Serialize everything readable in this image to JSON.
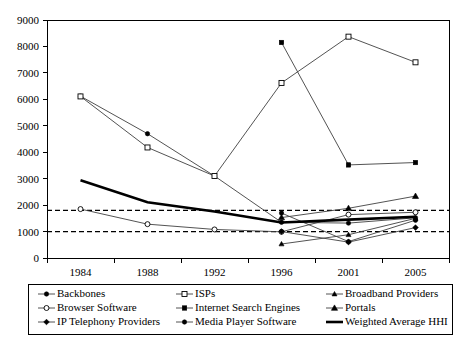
{
  "chart_data": {
    "type": "line",
    "title": "",
    "subtitle": "",
    "xlabel": "",
    "ylabel": "",
    "categories": [
      "1984",
      "1988",
      "1992",
      "1996",
      "2001",
      "2005"
    ],
    "ylim": [
      0,
      9000
    ],
    "ytick_step": 1000,
    "yticks": [
      "0",
      "1000",
      "2000",
      "3000",
      "4000",
      "5000",
      "6000",
      "7000",
      "8000",
      "9000"
    ],
    "grid": false,
    "legend_position": "bottom",
    "legend_columns": 3,
    "reference_lines": [
      {
        "name": "highly-concentrated-threshold",
        "value": 1800,
        "style": "dashed"
      },
      {
        "name": "moderately-concentrated-threshold",
        "value": 1000,
        "style": "dashed"
      }
    ],
    "series": [
      {
        "name": "Backbones",
        "marker": "filled-circle",
        "line": "thin",
        "x": [
          "1984",
          "1988",
          "1992",
          "1996",
          "2001",
          "2005"
        ],
        "values": [
          6120,
          4700,
          3100,
          1350,
          1320,
          1520
        ]
      },
      {
        "name": "ISPs",
        "marker": "hollow-square",
        "line": "thin",
        "x": [
          "1984",
          "1988",
          "1992",
          "1996",
          "2001",
          "2005"
        ],
        "values": [
          6110,
          4180,
          3100,
          6620,
          8370,
          7400
        ]
      },
      {
        "name": "Broadband Providers",
        "marker": "filled-triangle-small",
        "line": "thin",
        "x": [
          "1996",
          "2001",
          "2005"
        ],
        "values": [
          530,
          880,
          1500
        ]
      },
      {
        "name": "Browser Software",
        "marker": "hollow-circle",
        "line": "thin",
        "x": [
          "1984",
          "1988",
          "1992",
          "1996",
          "2001",
          "2005"
        ],
        "values": [
          1850,
          1280,
          1080,
          990,
          1640,
          1730
        ]
      },
      {
        "name": "Internet Search Engines",
        "marker": "filled-square",
        "line": "thin",
        "x": [
          "1996",
          "2001",
          "2005"
        ],
        "values": [
          8150,
          3520,
          3610
        ]
      },
      {
        "name": "Portals",
        "marker": "filled-triangle",
        "line": "thin",
        "x": [
          "1996",
          "2001",
          "2005"
        ],
        "values": [
          1530,
          1880,
          2340
        ]
      },
      {
        "name": "IP Telephony Providers",
        "marker": "filled-diamond",
        "line": "thin",
        "x": [
          "1996",
          "2001",
          "2005"
        ],
        "values": [
          1000,
          600,
          1150
        ]
      },
      {
        "name": "Media Player Software",
        "marker": "filled-circle",
        "line": "thin",
        "x": [
          "1996",
          "2001",
          "2005"
        ],
        "values": [
          1700,
          620,
          1430
        ]
      },
      {
        "name": "Weighted Average HHI",
        "marker": "none",
        "line": "bold",
        "x": [
          "1984",
          "1988",
          "1992",
          "1996",
          "2001",
          "2005"
        ],
        "values": [
          2940,
          2110,
          1760,
          1340,
          1450,
          1560
        ]
      }
    ],
    "legend": [
      {
        "label": "Backbones",
        "marker": "filled-circle",
        "line": "thin"
      },
      {
        "label": "ISPs",
        "marker": "hollow-square",
        "line": "thin"
      },
      {
        "label": "Broadband Providers",
        "marker": "filled-triangle-small",
        "line": "thin"
      },
      {
        "label": "Browser Software",
        "marker": "hollow-circle",
        "line": "thin"
      },
      {
        "label": "Internet Search Engines",
        "marker": "filled-square",
        "line": "thin"
      },
      {
        "label": "Portals",
        "marker": "filled-triangle",
        "line": "thin"
      },
      {
        "label": "IP Telephony Providers",
        "marker": "filled-diamond",
        "line": "thin"
      },
      {
        "label": "Media Player Software",
        "marker": "filled-circle",
        "line": "thin"
      },
      {
        "label": "Weighted Average HHI",
        "marker": "none",
        "line": "bold"
      }
    ],
    "colors": {
      "series_line": "#404040",
      "bold_line": "#000000",
      "axis": "#000000",
      "background": "#ffffff",
      "marker": "#000000"
    }
  }
}
